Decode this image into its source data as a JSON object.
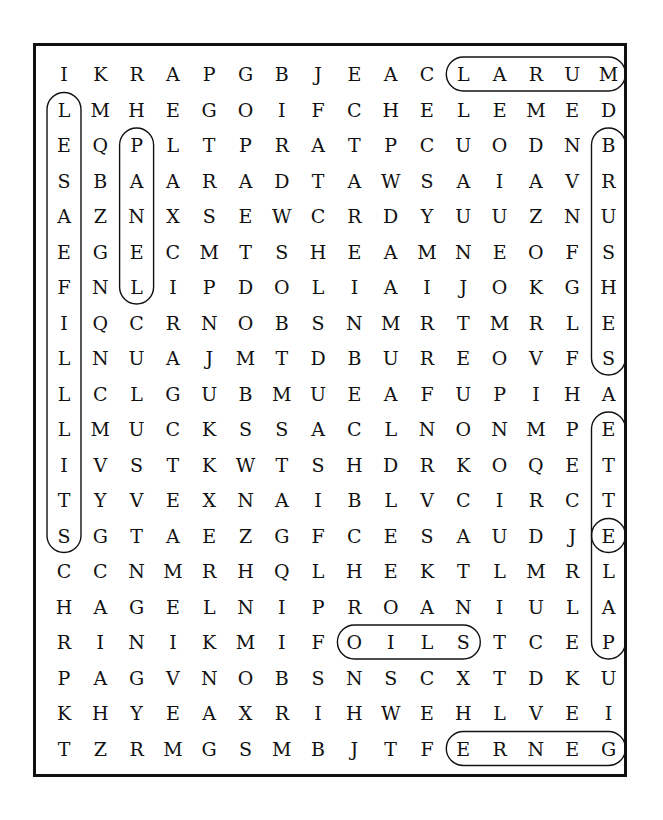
{
  "puzzle": {
    "type": "word-search",
    "cols": 16,
    "rows": 20,
    "grid": [
      "IKRAPGBJEACLARUM",
      "LMHEGOIFCHELEMED",
      "EQPLTPRATPCUODNB",
      "SBAARADTAWSAIAVR",
      "AZNXSEWCRDYUUZNU",
      "EGECMTSHEAMNEOFS",
      "FNLIPDOLIAIJOKGH",
      "IQCRNOBSNMRTMRLE",
      "LNUAJMTDBUREOVFS",
      "LCLGUBMUEAFUPIHA",
      "LMUCKSSACLNONMPE",
      "IVSTKWTSHDRKOQET",
      "TYVEXNAIBLVCIRCT",
      "SGTAEZGFCESAUDJE",
      "CCNMRHQLHEKTLMRL",
      "HAGELNIPROANIULA",
      "RINIKMIFOILSTCEP",
      "PAGVNOBSNSCXTDKU",
      "KHYEAXRIHWEHLVEI",
      "TZRMGSMBJTFERNEG"
    ],
    "found_words": [
      {
        "word": "LARUM",
        "start": [
          0,
          11
        ],
        "end": [
          0,
          15
        ]
      },
      {
        "word": "BRUSHES",
        "start": [
          2,
          15
        ],
        "end": [
          8,
          15
        ]
      },
      {
        "word": "LESAEFILLLITS",
        "start": [
          1,
          0
        ],
        "end": [
          13,
          0
        ]
      },
      {
        "word": "PANEL",
        "start": [
          2,
          2
        ],
        "end": [
          6,
          2
        ]
      },
      {
        "word": "ETTE",
        "start": [
          10,
          15
        ],
        "end": [
          13,
          15
        ]
      },
      {
        "word": "ELAP",
        "start": [
          13,
          15
        ],
        "end": [
          16,
          15
        ]
      },
      {
        "word": "OILS",
        "start": [
          16,
          8
        ],
        "end": [
          16,
          11
        ]
      },
      {
        "word": "ERNEG",
        "start": [
          19,
          11
        ],
        "end": [
          19,
          15
        ]
      }
    ],
    "colors": {
      "ink": "#111111",
      "background": "#ffffff"
    }
  }
}
